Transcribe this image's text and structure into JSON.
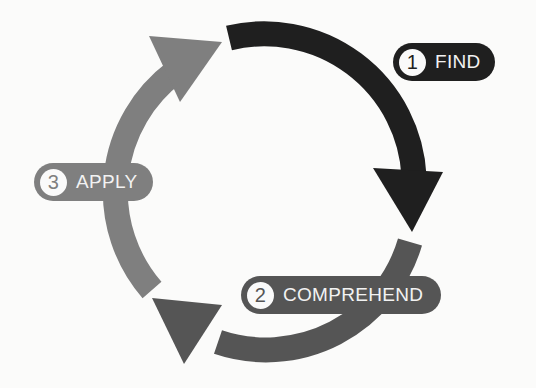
{
  "diagram": {
    "type": "cycle",
    "steps": [
      {
        "number": "1",
        "label": "FIND",
        "color": "#1f1f1f"
      },
      {
        "number": "2",
        "label": "COMPREHEND",
        "color": "#555555"
      },
      {
        "number": "3",
        "label": "APPLY",
        "color": "#7f7f7f"
      }
    ],
    "background": "#fbfbfa"
  }
}
